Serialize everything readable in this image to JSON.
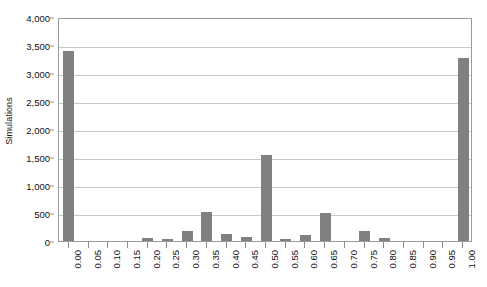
{
  "chart_data": {
    "type": "bar",
    "title": "",
    "xlabel": "",
    "ylabel": "Simulations",
    "categories": [
      "0.00",
      "0.05",
      "0.10",
      "0.15",
      "0.20",
      "0.25",
      "0.30",
      "0.35",
      "0.40",
      "0.45",
      "0.50",
      "0.55",
      "0.60",
      "0.65",
      "0.70",
      "0.75",
      "0.80",
      "0.85",
      "0.90",
      "0.95",
      "1.00"
    ],
    "values": [
      3390,
      0,
      0,
      0,
      50,
      30,
      180,
      520,
      130,
      70,
      1540,
      30,
      110,
      500,
      0,
      170,
      60,
      0,
      0,
      0,
      3270
    ],
    "ylim": [
      0,
      4000
    ],
    "ytick_values": [
      0,
      500,
      1000,
      1500,
      2000,
      2500,
      3000,
      3500,
      4000
    ],
    "ytick_labels": [
      "0",
      "500",
      "1,000",
      "1,500",
      "2,000",
      "2,500",
      "3,000",
      "3,500",
      "4,000"
    ],
    "grid": true,
    "legend": false,
    "bar_color": "#808080",
    "gridline_color": "#c9c9c9",
    "axis_color": "#9b9b9b"
  }
}
